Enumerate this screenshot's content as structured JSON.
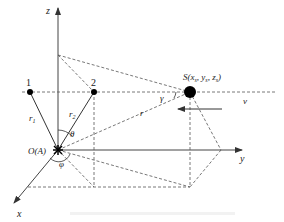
{
  "diagram": {
    "axes": {
      "z": "z",
      "y": "y",
      "x": "x"
    },
    "origin_label": "O(A)",
    "points": [
      {
        "id": "1",
        "label": "1"
      },
      {
        "id": "2",
        "label": "2"
      }
    ],
    "source_label": "S(x",
    "source_label_full": "S(xs, ys, zs)",
    "source": {
      "prefix": "S(x",
      "s1": "s",
      "mid1": ", y",
      "s2": "s",
      "mid2": ", z",
      "s3": "s",
      "suffix": ")"
    },
    "distances": {
      "r1": "r",
      "r1_sub": "1",
      "r2": "r",
      "r2_sub": "2",
      "r": "r"
    },
    "angles": {
      "theta": "θ",
      "phi": "φ",
      "gamma": "γ"
    },
    "velocity": "v",
    "colors": {
      "line": "#333333",
      "dash": "#555555",
      "point": "#000000"
    }
  }
}
